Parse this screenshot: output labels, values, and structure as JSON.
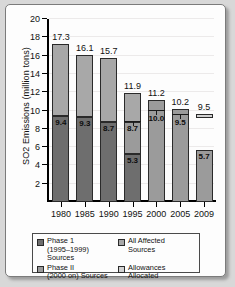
{
  "chart_data": {
    "type": "bar",
    "title": "",
    "subtitle": "",
    "xlabel": "",
    "ylabel": "SO2 Emissions (million tons)",
    "ylim": [
      0,
      20
    ],
    "yticks": [
      2,
      4,
      6,
      8,
      10,
      12,
      14,
      16,
      18,
      20
    ],
    "ytick_labels": [
      "2",
      "4",
      "6",
      "8",
      "10",
      "12",
      "14",
      "16",
      "18",
      "20"
    ],
    "grid": true,
    "grid_axis": "y",
    "legend_position": "bottom",
    "categories": [
      "1980",
      "1985",
      "1990",
      "1995",
      "2000",
      "2005",
      "2009"
    ],
    "series": [
      {
        "name": "Phase 1 (1995–1999) Sources",
        "color": "#6e6e6e",
        "values": [
          9.4,
          9.3,
          8.7,
          5.3,
          null,
          null,
          null
        ]
      },
      {
        "name": "Phase II (2000 on) Sources",
        "color": "#9b9b9b",
        "values": [
          null,
          null,
          null,
          3.4,
          11.2,
          10.2,
          5.7
        ]
      },
      {
        "name": "All Affected Sources",
        "color": "#a8a8a8",
        "values": [
          7.9,
          6.8,
          7.0,
          3.2,
          null,
          null,
          null
        ]
      },
      {
        "name": "Allowances Allocated",
        "color": "#d2d2d2",
        "values": [
          null,
          null,
          null,
          8.7,
          10.0,
          9.5,
          9.5
        ]
      }
    ],
    "bars": [
      {
        "category": "1980",
        "total": 17.3,
        "total_label": "17.3",
        "segments": [
          {
            "series": "Phase 1 (1995–1999) Sources",
            "from": 0,
            "to": 9.4,
            "label": "9.4"
          },
          {
            "series": "All Affected Sources",
            "from": 9.4,
            "to": 17.3,
            "label": ""
          }
        ],
        "allowance_line": null
      },
      {
        "category": "1985",
        "total": 16.1,
        "total_label": "16.1",
        "segments": [
          {
            "series": "Phase 1 (1995–1999) Sources",
            "from": 0,
            "to": 9.3,
            "label": "9.3"
          },
          {
            "series": "All Affected Sources",
            "from": 9.3,
            "to": 16.1,
            "label": ""
          }
        ],
        "allowance_line": null
      },
      {
        "category": "1990",
        "total": 15.7,
        "total_label": "15.7",
        "segments": [
          {
            "series": "Phase 1 (1995–1999) Sources",
            "from": 0,
            "to": 8.7,
            "label": "8.7"
          },
          {
            "series": "All Affected Sources",
            "from": 8.7,
            "to": 15.7,
            "label": ""
          }
        ],
        "allowance_line": null
      },
      {
        "category": "1995",
        "total": 11.9,
        "total_label": "11.9",
        "segments": [
          {
            "series": "Phase 1 (1995–1999) Sources",
            "from": 0,
            "to": 5.3,
            "label": "5.3"
          },
          {
            "series": "Phase II (2000 on) Sources",
            "from": 5.3,
            "to": 8.7,
            "label": "8.7"
          },
          {
            "series": "All Affected Sources",
            "from": 8.7,
            "to": 11.9,
            "label": ""
          }
        ],
        "allowance_line": 8.7,
        "allowance_label": "8.7"
      },
      {
        "category": "2000",
        "total": 11.2,
        "total_label": "11.2",
        "segments": [
          {
            "series": "Phase II (2000 on) Sources",
            "from": 0,
            "to": 11.2,
            "label": ""
          }
        ],
        "allowance_line": 10.0,
        "allowance_label": "10.0"
      },
      {
        "category": "2005",
        "total": 10.2,
        "total_label": "10.2",
        "segments": [
          {
            "series": "Phase II (2000 on) Sources",
            "from": 0,
            "to": 10.2,
            "label": ""
          }
        ],
        "allowance_line": 9.5,
        "allowance_label": "9.5"
      },
      {
        "category": "2009",
        "total": 5.7,
        "total_label": "",
        "segments": [
          {
            "series": "Phase II (2000 on) Sources",
            "from": 0,
            "to": 5.7,
            "label": "5.7"
          }
        ],
        "allowance_line": null,
        "floating_allowance": {
          "from": 9.2,
          "to": 9.6,
          "label": "9.5"
        }
      }
    ],
    "annotations": [
      {
        "text": "17.3",
        "category": "1980",
        "value": 17.3,
        "position": "above-bar"
      },
      {
        "text": "16.1",
        "category": "1985",
        "value": 16.1,
        "position": "above-bar"
      },
      {
        "text": "15.7",
        "category": "1990",
        "value": 15.7,
        "position": "above-bar"
      },
      {
        "text": "11.9",
        "category": "1995",
        "value": 11.9,
        "position": "above-bar"
      },
      {
        "text": "11.2",
        "category": "2000",
        "value": 11.2,
        "position": "above-bar"
      },
      {
        "text": "10.2",
        "category": "2005",
        "value": 10.2,
        "position": "above-bar"
      },
      {
        "text": "9.5",
        "category": "2009",
        "value": 9.5,
        "position": "above-float"
      },
      {
        "text": "9.4",
        "category": "1980",
        "value": 9.4,
        "position": "in-bar"
      },
      {
        "text": "9.3",
        "category": "1985",
        "value": 9.3,
        "position": "in-bar"
      },
      {
        "text": "8.7",
        "category": "1990",
        "value": 8.7,
        "position": "in-bar"
      },
      {
        "text": "5.3",
        "category": "1995",
        "value": 5.3,
        "position": "in-bar"
      },
      {
        "text": "8.7",
        "category": "1995",
        "value": 8.7,
        "position": "in-bar"
      },
      {
        "text": "10.0",
        "category": "2000",
        "value": 10.0,
        "position": "in-bar"
      },
      {
        "text": "9.5",
        "category": "2005",
        "value": 9.5,
        "position": "in-bar"
      },
      {
        "text": "5.7",
        "category": "2009",
        "value": 5.7,
        "position": "in-bar"
      }
    ]
  },
  "axis": {
    "ylabel": "SO2 Emissions (million tons)",
    "ytick_labels": [
      "20",
      "18",
      "16",
      "14",
      "12",
      "10",
      "8",
      "6",
      "4",
      "2"
    ],
    "xtick_labels": [
      "1980",
      "1985",
      "1990",
      "1995",
      "2000",
      "2005",
      "2009"
    ]
  },
  "legend": {
    "items": [
      {
        "label_line1": "Phase 1",
        "label_line2": "(1995–1999) Sources",
        "color": "#6e6e6e",
        "name": "phase-1"
      },
      {
        "label_line1": "All Affected",
        "label_line2": "Sources",
        "color": "#a8a8a8",
        "name": "all-affected"
      },
      {
        "label_line1": "Phase II",
        "label_line2": "(2000 on) Sources",
        "color": "#9b9b9b",
        "name": "phase-2"
      },
      {
        "label_line1": "Allowances",
        "label_line2": "Allocated",
        "color": "#d2d2d2",
        "name": "allowances"
      }
    ]
  },
  "bar_labels": {
    "tops": [
      "17.3",
      "16.1",
      "15.7",
      "11.9",
      "11.2",
      "10.2",
      "9.5"
    ],
    "inner": [
      "9.4",
      "9.3",
      "8.7",
      "5.3",
      "10.0",
      "9.5",
      "5.7"
    ],
    "mid_1995": "8.7"
  }
}
